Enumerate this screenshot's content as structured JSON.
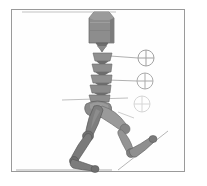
{
  "panel": {
    "title": "Articulated human figure — sagittal walking pose",
    "background_color": "#ffffff",
    "frame_color": "#9a9a9a",
    "figure_fill": "#8a8a8a",
    "figure_fill_dark": "#6e6e6e",
    "figure_fill_light": "#a0a0a0",
    "figure_stroke": "#5d5d5d",
    "marker_color": "#b0b0b0",
    "leader_line_color": "#9c9c9c",
    "reference_line_color": "#b5b5b5"
  },
  "markers": [
    {
      "name": "joint-marker-upper",
      "label": "",
      "cx": 146,
      "cy": 58,
      "r": 8,
      "opacity": 0.95
    },
    {
      "name": "joint-marker-middle",
      "label": "",
      "cx": 145,
      "cy": 81,
      "r": 8,
      "opacity": 0.9
    },
    {
      "name": "joint-marker-lower",
      "label": "",
      "cx": 142,
      "cy": 104,
      "r": 8,
      "opacity": 0.55
    }
  ],
  "leader_lines": [
    {
      "name": "leader-line-upper",
      "x1": 110,
      "y1": 56,
      "x2": 138,
      "y2": 58
    },
    {
      "name": "leader-line-middle",
      "x1": 108,
      "y1": 80,
      "x2": 137,
      "y2": 81
    }
  ],
  "reference_lines": [
    {
      "name": "reference-line-top",
      "x1": 22,
      "y1": 12,
      "x2": 116,
      "y2": 12
    },
    {
      "name": "reference-line-hip",
      "x1": 62,
      "y1": 100,
      "x2": 128,
      "y2": 98
    },
    {
      "name": "ground-line",
      "x1": 16,
      "y1": 170,
      "x2": 112,
      "y2": 170
    },
    {
      "name": "incline-line-foot",
      "x1": 120,
      "y1": 168,
      "x2": 166,
      "y2": 133
    }
  ],
  "body_segments": [
    {
      "name": "segment-torso-block",
      "kind": "torso"
    },
    {
      "name": "segment-neck-wedge",
      "kind": "neck"
    },
    {
      "name": "segment-vertebra-1",
      "kind": "vertebra"
    },
    {
      "name": "segment-vertebra-2",
      "kind": "vertebra"
    },
    {
      "name": "segment-vertebra-3",
      "kind": "vertebra"
    },
    {
      "name": "segment-vertebra-4",
      "kind": "vertebra"
    },
    {
      "name": "segment-vertebra-5",
      "kind": "vertebra"
    },
    {
      "name": "segment-pelvis",
      "kind": "pelvis"
    },
    {
      "name": "segment-thigh-left",
      "kind": "thigh"
    },
    {
      "name": "segment-shank-left",
      "kind": "shank"
    },
    {
      "name": "segment-foot-left",
      "kind": "foot"
    },
    {
      "name": "segment-thigh-right",
      "kind": "thigh"
    },
    {
      "name": "segment-shank-right",
      "kind": "shank"
    },
    {
      "name": "segment-foot-right",
      "kind": "foot"
    }
  ]
}
